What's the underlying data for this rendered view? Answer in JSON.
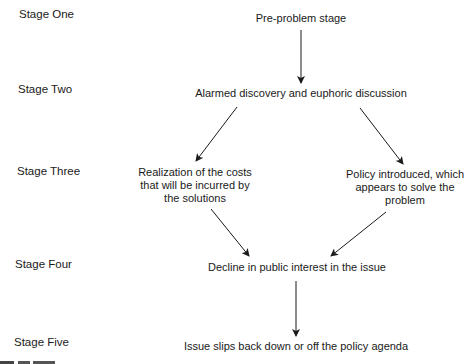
{
  "stages": [
    {
      "label": "Stage One"
    },
    {
      "label": "Stage Two"
    },
    {
      "label": "Stage Three"
    },
    {
      "label": "Stage Four"
    },
    {
      "label": "Stage Five"
    }
  ],
  "nodes": {
    "pre_problem": "Pre-problem stage",
    "alarmed_discovery": "Alarmed discovery and euphoric discussion",
    "realization_costs": [
      "Realization of the costs",
      "that will be incurred by",
      "the solutions"
    ],
    "policy_introduced": [
      "Policy introduced, which",
      "appears to solve the",
      "problem"
    ],
    "decline_interest": "Decline in public interest in the issue",
    "issue_slips": "Issue slips back down or off the policy agenda"
  },
  "edges": [
    {
      "from": "pre_problem",
      "to": "alarmed_discovery"
    },
    {
      "from": "alarmed_discovery",
      "to": "realization_costs"
    },
    {
      "from": "alarmed_discovery",
      "to": "policy_introduced"
    },
    {
      "from": "realization_costs",
      "to": "decline_interest"
    },
    {
      "from": "policy_introduced",
      "to": "decline_interest"
    },
    {
      "from": "decline_interest",
      "to": "issue_slips"
    }
  ]
}
